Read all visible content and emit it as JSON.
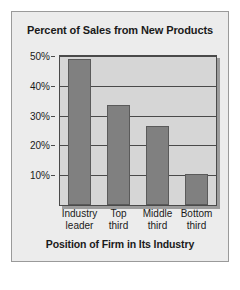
{
  "chart_data": {
    "type": "bar",
    "title": "Percent of Sales from New Products",
    "xlabel": "Position of Firm in Its Industry",
    "ylabel": "",
    "categories": [
      "Industry leader",
      "Top third",
      "Middle third",
      "Bottom third"
    ],
    "category_lines": [
      [
        "Industry",
        "leader"
      ],
      [
        "Top",
        "third"
      ],
      [
        "Middle",
        "third"
      ],
      [
        "Bottom",
        "third"
      ]
    ],
    "values": [
      49,
      33.5,
      26.5,
      10.5
    ],
    "value_labels": [
      "49%",
      "33.5%",
      "26.5%",
      "10.5%"
    ],
    "ylim": [
      0,
      50
    ],
    "yticks": [
      10,
      20,
      30,
      40,
      50
    ],
    "ytick_labels": [
      "10%",
      "20%",
      "30%",
      "40%",
      "50%"
    ],
    "grid": true,
    "legend": "none",
    "colors": {
      "bar_fill": "#808080",
      "bar_border": "#5a5a5a",
      "plot_background": "#d6d6d6",
      "card_background": "#ececec",
      "card_border": "#9a9a9a",
      "axis_line": "#4a4a4a",
      "text": "#1a1a1a",
      "page_background": "#ffffff",
      "shadow": "#9c9c9c"
    }
  }
}
